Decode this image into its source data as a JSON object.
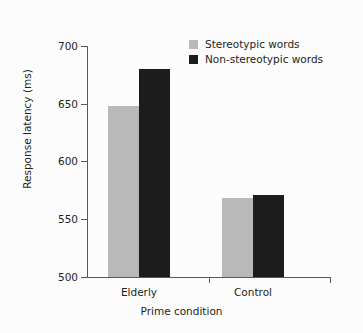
{
  "chart_data": {
    "type": "bar",
    "title": "",
    "subtitle": "",
    "categories": [
      "Elderly",
      "Control"
    ],
    "series": [
      {
        "name": "Stereotypic words",
        "values": [
          648,
          568
        ],
        "color": "#b9b9b9"
      },
      {
        "name": "Non-stereotypic words",
        "values": [
          680,
          571
        ],
        "color": "#1c1c1c"
      }
    ],
    "xlabel": "Prime condition",
    "ylabel": "Response latency (ms)",
    "ylim": [
      500,
      700
    ],
    "yticks": [
      500,
      550,
      600,
      650,
      700
    ],
    "ytick_labels": [
      "500",
      "550",
      "600",
      "650",
      "700"
    ],
    "grid": false,
    "legend_position": "top-right",
    "annotations": []
  },
  "legend": {
    "entries": [
      {
        "label": "Stereotypic words"
      },
      {
        "label": "Non-stereotypic words"
      }
    ]
  },
  "axes": {
    "x_title": "Prime condition",
    "y_title": "Response latency (ms)",
    "x_tick_labels": [
      "Elderly",
      "Control"
    ],
    "y_tick_labels": [
      "700",
      "650",
      "600",
      "550",
      "500"
    ]
  },
  "colors": {
    "background": "#fcfcfc",
    "axis": "#58595b",
    "text": "#231f20",
    "series_light": "#b9b9b9",
    "series_dark": "#1c1c1c"
  }
}
